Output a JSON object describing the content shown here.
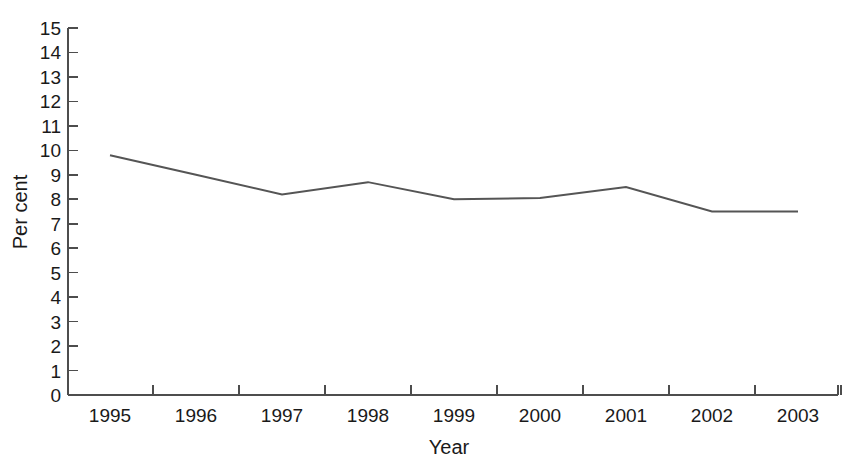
{
  "chart_data": {
    "type": "line",
    "title": "",
    "xlabel": "Year",
    "ylabel": "Per cent",
    "categories": [
      "1995",
      "1996",
      "1997",
      "1998",
      "1999",
      "2000",
      "2001",
      "2002",
      "2003"
    ],
    "values": [
      9.8,
      9.0,
      8.2,
      8.7,
      8.0,
      8.05,
      8.5,
      7.5,
      7.5
    ],
    "series": [
      {
        "name": "Per cent",
        "color": "#555555",
        "values": [
          9.8,
          9.0,
          8.2,
          8.7,
          8.0,
          8.05,
          8.5,
          7.5,
          7.5
        ]
      }
    ],
    "ylim": [
      0,
      15
    ],
    "yticks": [
      0,
      1,
      2,
      3,
      4,
      5,
      6,
      7,
      8,
      9,
      10,
      11,
      12,
      13,
      14,
      15
    ],
    "ytick_labels": [
      "0",
      "1",
      "2",
      "3",
      "4",
      "5",
      "6",
      "7",
      "8",
      "9",
      "10",
      "11",
      "12",
      "13",
      "14",
      "15"
    ],
    "xtick_labels": [
      "1995",
      "1996",
      "1997",
      "1998",
      "1999",
      "2000",
      "2001",
      "2002",
      "2003"
    ],
    "grid": false,
    "legend": "none",
    "markers": "none",
    "line_width": 2,
    "axis_color": "#4d4d4d",
    "background": "#ffffff"
  }
}
